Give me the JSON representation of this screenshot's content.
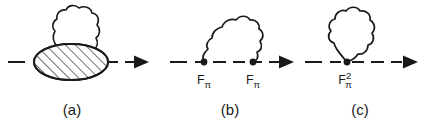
{
  "figure": {
    "background_color": "#ffffff",
    "ink_color": "#1a1a1a",
    "width": 435,
    "height": 128
  },
  "panels": [
    {
      "id": "panel-a",
      "caption": "(a)",
      "line_style": "dashed",
      "has_arrow": true,
      "blob": "hatched-ellipse",
      "loop": "wavy-closed-blob",
      "vertices": []
    },
    {
      "id": "panel-b",
      "caption": "(b)",
      "line_style": "dashed",
      "has_arrow": true,
      "blob": "none",
      "loop": "wavy-open-arc",
      "vertices": [
        {
          "base": "F",
          "sub": "π",
          "sup": ""
        },
        {
          "base": "F",
          "sub": "π",
          "sup": ""
        }
      ]
    },
    {
      "id": "panel-c",
      "caption": "(c)",
      "line_style": "dashed",
      "has_arrow": true,
      "blob": "none",
      "loop": "wavy-teardrop-loop",
      "vertices": [
        {
          "base": "F",
          "sub": "π",
          "sup": "2"
        }
      ]
    }
  ],
  "labels": {
    "caption_a": "(a)",
    "caption_b": "(b)",
    "caption_c": "(c)",
    "f_pi_base": "F",
    "f_pi_sub": "π",
    "f_pi_sq_sup": "2"
  }
}
